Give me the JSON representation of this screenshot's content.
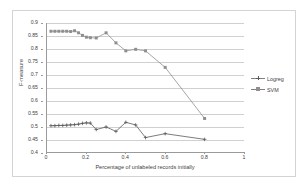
{
  "chart_data": {
    "type": "line",
    "title": "",
    "xlabel": "Percentage of unlabeled records initially",
    "ylabel": "F-measure",
    "xlim": [
      0,
      1
    ],
    "ylim": [
      0.4,
      0.9
    ],
    "xticks": [
      "0",
      "0.2",
      "0.4",
      "0.6",
      "0.8",
      "1"
    ],
    "xtick_values": [
      0,
      0.2,
      0.4,
      0.6,
      0.8,
      1
    ],
    "yticks": [
      "0.4",
      "0.45",
      "0.5",
      "0.55",
      "0.6",
      "0.65",
      "0.7",
      "0.75",
      "0.8",
      "0.85",
      "0.9"
    ],
    "ytick_values": [
      0.4,
      0.45,
      0.5,
      0.55,
      0.6,
      0.65,
      0.7,
      0.75,
      0.8,
      0.85,
      0.9
    ],
    "grid": "horizontal",
    "legend_position": "right",
    "series": [
      {
        "name": "Logreg",
        "marker": "cross",
        "color": "#595959",
        "x": [
          0.02,
          0.04,
          0.06,
          0.08,
          0.1,
          0.12,
          0.14,
          0.16,
          0.18,
          0.2,
          0.22,
          0.25,
          0.3,
          0.35,
          0.4,
          0.45,
          0.5,
          0.6,
          0.8
        ],
        "values": [
          0.502,
          0.502,
          0.503,
          0.503,
          0.504,
          0.505,
          0.506,
          0.508,
          0.511,
          0.513,
          0.512,
          0.487,
          0.497,
          0.48,
          0.515,
          0.505,
          0.456,
          0.471,
          0.449
        ]
      },
      {
        "name": "SVM",
        "marker": "square",
        "color": "#8f8f8f",
        "x": [
          0.02,
          0.04,
          0.06,
          0.08,
          0.1,
          0.12,
          0.14,
          0.16,
          0.18,
          0.2,
          0.22,
          0.25,
          0.3,
          0.35,
          0.4,
          0.45,
          0.5,
          0.6,
          0.8
        ],
        "values": [
          0.868,
          0.868,
          0.868,
          0.868,
          0.868,
          0.867,
          0.87,
          0.862,
          0.852,
          0.845,
          0.843,
          0.842,
          0.862,
          0.823,
          0.792,
          0.798,
          0.792,
          0.728,
          0.53
        ]
      }
    ]
  },
  "legend": {
    "items": [
      {
        "label": "Logreg"
      },
      {
        "label": "SVM"
      }
    ]
  }
}
